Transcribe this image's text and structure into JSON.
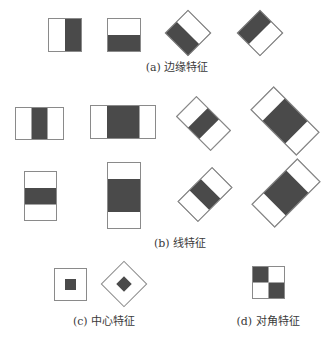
{
  "colors": {
    "dark": "#4a4a4a",
    "outline": "#8a8a8a",
    "background": "#ffffff",
    "text": "#3a3a3a"
  },
  "captions": {
    "a": "(a) 边缘特征",
    "b": "(b) 线特征",
    "c": "(c) 中心特征",
    "d": "(d) 对角特征"
  },
  "groups": [
    {
      "id": "a",
      "name": "Edge features",
      "count": 4
    },
    {
      "id": "b",
      "name": "Line features",
      "count": 8
    },
    {
      "id": "c",
      "name": "Center-surround features",
      "count": 2
    },
    {
      "id": "d",
      "name": "Diagonal features",
      "count": 1
    }
  ]
}
